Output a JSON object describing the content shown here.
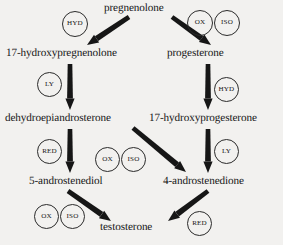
{
  "diagram": {
    "background_color": "#f2f1ef",
    "ink_color": "#161616",
    "nodes": [
      {
        "id": "pregnenolone",
        "label": "pregnenolone",
        "x": 104,
        "y": 2,
        "align": "left"
      },
      {
        "id": "17-hydroxypregnenolone",
        "label": "17-hydroxypregnenolone",
        "x": 6,
        "y": 47,
        "align": "left"
      },
      {
        "id": "progesterone",
        "label": "progesterone",
        "x": 167,
        "y": 47,
        "align": "left"
      },
      {
        "id": "dehydroepiandrosterone",
        "label": "dehydroepiandrosterone",
        "x": 5,
        "y": 112,
        "align": "left"
      },
      {
        "id": "17-hydroxyprogesterone",
        "label": "17-hydroxyprogesterone",
        "x": 149,
        "y": 112,
        "align": "left"
      },
      {
        "id": "5-androstenediol",
        "label": "5-androstenediol",
        "x": 29,
        "y": 175,
        "align": "left"
      },
      {
        "id": "4-androstenedione",
        "label": "4-androstenedione",
        "x": 163,
        "y": 175,
        "align": "left"
      },
      {
        "id": "testosterone",
        "label": "testosterone",
        "x": 100,
        "y": 221,
        "align": "left"
      }
    ],
    "enzymes": [
      {
        "id": "hyd-preg-to-17ohpreg",
        "label": "HYD",
        "x": 62,
        "y": 11,
        "d": 26
      },
      {
        "id": "ox-preg-to-prog",
        "label": "OX",
        "x": 187,
        "y": 10,
        "d": 26
      },
      {
        "id": "iso-preg-to-prog",
        "label": "ISO",
        "x": 214,
        "y": 10,
        "d": 26
      },
      {
        "id": "ly-17ohpreg-to-dhea",
        "label": "LY",
        "x": 37,
        "y": 72,
        "d": 25
      },
      {
        "id": "hyd-prog-to-17ohprog",
        "label": "HYD",
        "x": 214,
        "y": 77,
        "d": 25
      },
      {
        "id": "red-dhea-to-5andiol",
        "label": "RED",
        "x": 37,
        "y": 139,
        "d": 25
      },
      {
        "id": "ox-dhea-to-4andione",
        "label": "OX",
        "x": 95,
        "y": 147,
        "d": 25
      },
      {
        "id": "iso-dhea-to-4andione",
        "label": "ISO",
        "x": 121,
        "y": 147,
        "d": 25
      },
      {
        "id": "ly-17ohprog-to-4andione",
        "label": "LY",
        "x": 214,
        "y": 139,
        "d": 25
      },
      {
        "id": "ox-5andiol-to-testo",
        "label": "OX",
        "x": 34,
        "y": 204,
        "d": 25
      },
      {
        "id": "iso-5andiol-to-testo",
        "label": "ISO",
        "x": 60,
        "y": 204,
        "d": 25
      },
      {
        "id": "red-4andione-to-testo",
        "label": "RED",
        "x": 187,
        "y": 211,
        "d": 25
      }
    ],
    "arrows": [
      {
        "id": "arrow-pregnenolone-to-17-hydroxypregnenolone",
        "from": "pregnenolone",
        "to": "17-hydroxypregnenolone",
        "x1": 129,
        "y1": 17,
        "x2": 87,
        "y2": 45
      },
      {
        "id": "arrow-pregnenolone-to-progesterone",
        "from": "pregnenolone",
        "to": "progesterone",
        "x1": 172,
        "y1": 17,
        "x2": 211,
        "y2": 45
      },
      {
        "id": "arrow-17-hydroxypregnenolone-to-dhea",
        "from": "17-hydroxypregnenolone",
        "to": "dehydroepiandrosterone",
        "x1": 70,
        "y1": 64,
        "x2": 70,
        "y2": 110
      },
      {
        "id": "arrow-progesterone-to-17-hydroxyprogesterone",
        "from": "progesterone",
        "to": "17-hydroxyprogesterone",
        "x1": 208,
        "y1": 64,
        "x2": 208,
        "y2": 110
      },
      {
        "id": "arrow-dhea-to-5-androstenediol",
        "from": "dehydroepiandrosterone",
        "to": "5-androstenediol",
        "x1": 70,
        "y1": 129,
        "x2": 70,
        "y2": 173
      },
      {
        "id": "arrow-dhea-to-4-androstenedione",
        "from": "dehydroepiandrosterone",
        "to": "4-androstenedione",
        "x1": 133,
        "y1": 128,
        "x2": 186,
        "y2": 172
      },
      {
        "id": "arrow-17-hydroxyprogesterone-to-4-androstenedione",
        "from": "17-hydroxyprogesterone",
        "to": "4-androstenedione",
        "x1": 208,
        "y1": 129,
        "x2": 208,
        "y2": 173
      },
      {
        "id": "arrow-5-androstenediol-to-testosterone",
        "from": "5-androstenediol",
        "to": "testosterone",
        "x1": 68,
        "y1": 191,
        "x2": 111,
        "y2": 221
      },
      {
        "id": "arrow-4-androstenedione-to-testosterone",
        "from": "4-androstenedione",
        "to": "testosterone",
        "x1": 208,
        "y1": 191,
        "x2": 168,
        "y2": 221
      }
    ]
  }
}
